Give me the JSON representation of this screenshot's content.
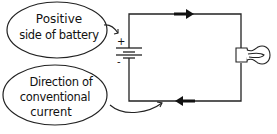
{
  "diagram": {
    "type": "circuit",
    "callouts": [
      {
        "id": "positive",
        "line1": "Positive",
        "line2": "side of battery"
      },
      {
        "id": "direction",
        "line1": "Direction of",
        "line2": "conventional",
        "line3": "current"
      }
    ],
    "battery": {
      "plus_sign": "+",
      "minus_sign": "-"
    },
    "components": [
      "battery",
      "wire",
      "light-bulb",
      "current-arrow-top-right",
      "current-arrow-bottom-left"
    ],
    "colors": {
      "ink": "#111111",
      "background": "#ffffff"
    }
  }
}
